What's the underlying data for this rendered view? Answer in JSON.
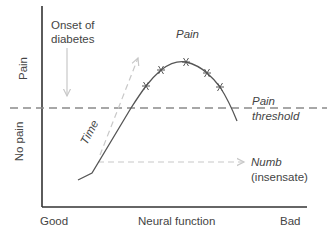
{
  "diagram": {
    "type": "conceptual-line-diagram",
    "axes": {
      "y_top_label": "Pain",
      "y_bottom_label": "No pain",
      "x_left_label": "Good",
      "x_center_label": "Neural function",
      "x_right_label": "Bad"
    },
    "annotations": {
      "onset": "Onset of diabetes",
      "onset_line1": "Onset of",
      "onset_line2": "diabetes",
      "pain": "Pain",
      "threshold_line1": "Pain",
      "threshold_line2": "threshold",
      "time": "Time",
      "numb_line1": "Numb",
      "numb_line2": "(insensate)"
    },
    "colors": {
      "axis": "#333333",
      "curve": "#555555",
      "threshold_dash": "#8a8a8a",
      "arrows": "#c8c8c8"
    },
    "curve_points": [
      [
        78,
        180
      ],
      [
        92,
        173
      ],
      [
        131,
        108
      ],
      [
        146,
        86
      ],
      [
        161,
        70
      ],
      [
        186,
        62
      ],
      [
        207,
        73
      ],
      [
        220,
        87
      ],
      [
        237,
        121
      ]
    ],
    "markers": [
      [
        146,
        86
      ],
      [
        161,
        70
      ],
      [
        186,
        62
      ],
      [
        207,
        73
      ],
      [
        220,
        87
      ]
    ]
  }
}
